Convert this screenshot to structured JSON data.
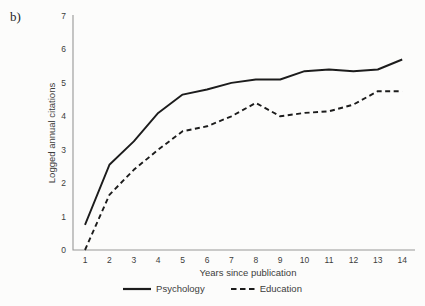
{
  "panel_label": "b)",
  "colors": {
    "line": "#1c1c1c",
    "axis": "#979797",
    "text": "#3c3c3c"
  },
  "chart_data": {
    "type": "line",
    "title": "",
    "xlabel": "Years since publication",
    "ylabel": "Logged annual citations",
    "x": [
      1,
      2,
      3,
      4,
      5,
      6,
      7,
      8,
      9,
      10,
      11,
      12,
      13,
      14
    ],
    "xlim": [
      1,
      14
    ],
    "ylim": [
      0,
      7
    ],
    "yticks": [
      0,
      1,
      2,
      3,
      4,
      5,
      6,
      7
    ],
    "grid": "off",
    "legend_position": "bottom",
    "series": [
      {
        "name": "Psychology",
        "style": "solid",
        "values": [
          0.75,
          2.55,
          3.25,
          4.1,
          4.65,
          4.8,
          5.0,
          5.1,
          5.1,
          5.35,
          5.4,
          5.35,
          5.4,
          5.7
        ]
      },
      {
        "name": "Education",
        "style": "dashed",
        "values": [
          0.0,
          1.65,
          2.4,
          3.0,
          3.55,
          3.7,
          4.0,
          4.4,
          4.0,
          4.1,
          4.15,
          4.35,
          4.75,
          4.75
        ]
      }
    ]
  }
}
